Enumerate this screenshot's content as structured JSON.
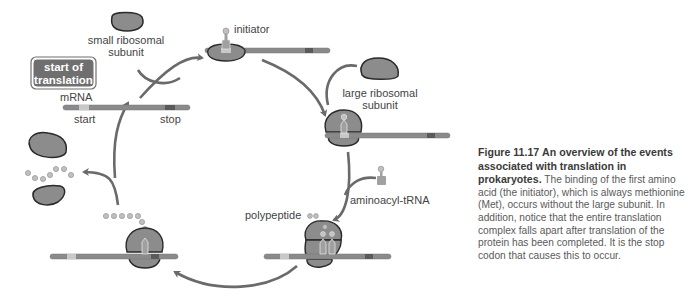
{
  "figure": {
    "number": "Figure 11.17",
    "title": "An overview of the events associated with translation in prokaryotes.",
    "caption_body": "The binding of the first amino acid (the initiator), which is always methionine (Met), occurs without the large subunit. In addition, notice that the entire translation complex falls apart after translation of the protein has been completed. It is the stop codon that causes this to occur."
  },
  "labels": {
    "start_badge_line1": "start of",
    "start_badge_line2": "translation",
    "mrna": "mRNA",
    "start": "start",
    "stop": "stop",
    "small_subunit_line1": "small ribosomal",
    "small_subunit_line2": "subunit",
    "initiator": "initiator",
    "large_subunit_line1": "large ribosomal",
    "large_subunit_line2": "subunit",
    "aminoacyl_trna": "aminoacyl-tRNA",
    "polypeptide": "polypeptide"
  },
  "stages": [
    {
      "name": "free-mrna",
      "description": "mRNA with start and stop codons"
    },
    {
      "name": "initiation-complex",
      "description": "small subunit + initiator tRNA bound to mRNA"
    },
    {
      "name": "full-ribosome",
      "description": "large subunit joins"
    },
    {
      "name": "elongation",
      "description": "aminoacyl-tRNA enters; polypeptide grows"
    },
    {
      "name": "termination",
      "description": "ribosome reaches stop codon with long polypeptide"
    },
    {
      "name": "disassembly",
      "description": "subunits and polypeptide released"
    }
  ],
  "colors": {
    "mrna": "#8a8a8a",
    "start_codon": "#c8c8c8",
    "stop_codon": "#5a5a5a",
    "ribosome": "#8c8c8c",
    "outline": "#2a2a2a",
    "arrow": "#6a6a6a",
    "badge": "#6f6f6f",
    "trna": "#a0a0a0",
    "amino_acid": "#c0c0c0"
  }
}
